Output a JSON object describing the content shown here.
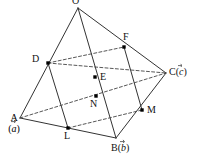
{
  "figure": {
    "type": "tetrahedron-midpoint-diagram",
    "background_color": "#ffffff",
    "line_color": "#333333",
    "point_color": "#000000",
    "vertices": {
      "O": {
        "label": "O",
        "x": 78,
        "y": 8,
        "label_dx": -4,
        "label_dy": -9
      },
      "A": {
        "label": "A",
        "x": 20,
        "y": 118,
        "label_dx": -14,
        "label_dy": -2
      },
      "B": {
        "label": "B",
        "x": 116,
        "y": 138,
        "label_dx": -2,
        "label_dy": 4
      },
      "C": {
        "label": "C",
        "x": 166,
        "y": 73,
        "label_dx": 4,
        "label_dy": -3
      },
      "D": {
        "label": "D",
        "x": 48,
        "y": 63,
        "label_dx": -13,
        "label_dy": -4
      },
      "E": {
        "label": "E",
        "x": 95,
        "y": 77,
        "label_dx": 5,
        "label_dy": -5
      },
      "F": {
        "label": "F",
        "x": 124,
        "y": 47,
        "label_dx": 2,
        "label_dy": -13
      },
      "L": {
        "label": "L",
        "x": 68,
        "y": 128,
        "label_dx": -3,
        "label_dy": 3
      },
      "M": {
        "label": "M",
        "x": 142,
        "y": 110,
        "label_dx": 5,
        "label_dy": -3
      },
      "N": {
        "label": "N",
        "x": 96,
        "y": 96,
        "label_dx": -4,
        "label_dy": 3
      }
    },
    "vector_labels": {
      "A": {
        "point": "A",
        "letter": "A",
        "vector": "a",
        "open_paren": "(",
        "close_paren": ")"
      },
      "B": {
        "point": "B",
        "letter": "B",
        "vector": "b",
        "open_paren": "(",
        "close_paren": ")"
      },
      "C": {
        "point": "C",
        "letter": "C",
        "vector": "c",
        "open_paren": "(",
        "close_paren": ")"
      }
    },
    "solid_edges": [
      {
        "name": "edge-O-A",
        "from": "O",
        "to": "A"
      },
      {
        "name": "edge-O-B",
        "from": "O",
        "to": "B"
      },
      {
        "name": "edge-O-C",
        "from": "O",
        "to": "C"
      },
      {
        "name": "edge-A-B",
        "from": "A",
        "to": "B"
      },
      {
        "name": "edge-B-C",
        "from": "B",
        "to": "C"
      },
      {
        "name": "edge-D-L",
        "from": "D",
        "to": "L"
      },
      {
        "name": "edge-F-M",
        "from": "F",
        "to": "M"
      }
    ],
    "dashed_edges": [
      {
        "name": "edge-A-C",
        "from": "A",
        "to": "C"
      },
      {
        "name": "edge-D-F",
        "from": "D",
        "to": "F"
      },
      {
        "name": "edge-D-C-through-E",
        "from": "D",
        "to": "C"
      },
      {
        "name": "edge-L-M",
        "from": "L",
        "to": "M"
      }
    ],
    "marked_points": [
      "D",
      "E",
      "F",
      "L",
      "M",
      "N"
    ]
  }
}
